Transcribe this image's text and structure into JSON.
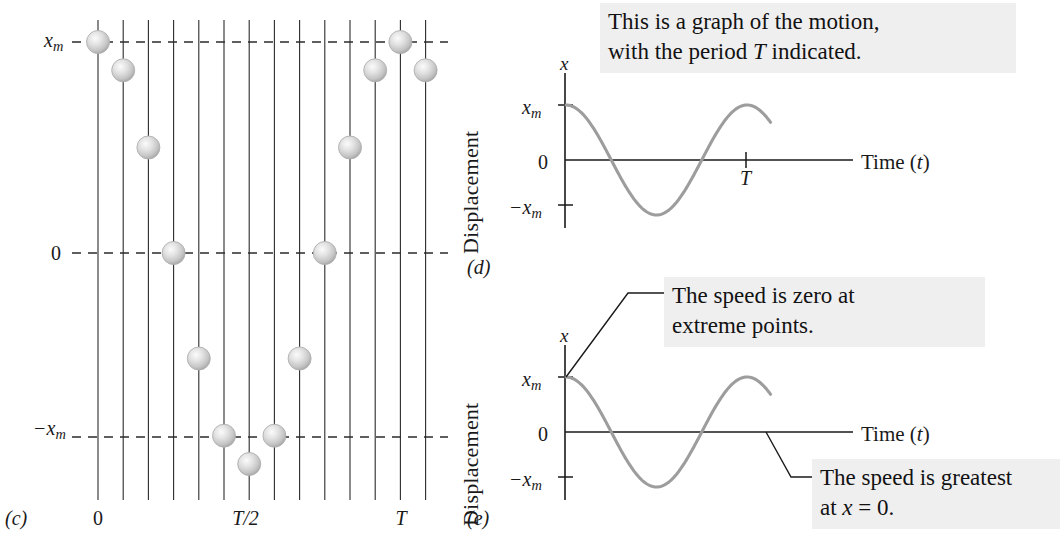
{
  "figure": {
    "panels": [
      {
        "id": "c",
        "label": "(c)"
      },
      {
        "id": "d",
        "label": "(d)"
      },
      {
        "id": "e",
        "label": "(e)"
      }
    ]
  },
  "panel_c": {
    "label": "(c)",
    "y_axis_labels": {
      "top": "x",
      "top_sub": "m",
      "middle": "0",
      "bottom_prefix": "−x",
      "bottom_sub": "m"
    },
    "x_tick_labels": [
      {
        "text": "0",
        "line_index": 0
      },
      {
        "text": "T/2",
        "line_index": 6
      },
      {
        "text": "T",
        "line_index": 12
      }
    ],
    "num_vertical_lines": 14,
    "ball_positions": [
      {
        "line_index": 0,
        "value": 1.0
      },
      {
        "line_index": 1,
        "value": 0.866
      },
      {
        "line_index": 2,
        "value": 0.5
      },
      {
        "line_index": 3,
        "value": 0.0
      },
      {
        "line_index": 4,
        "value": -0.5
      },
      {
        "line_index": 5,
        "value": -0.866
      },
      {
        "line_index": 6,
        "value": -1.0
      },
      {
        "line_index": 7,
        "value": -0.866
      },
      {
        "line_index": 8,
        "value": -0.5
      },
      {
        "line_index": 9,
        "value": 0.0
      },
      {
        "line_index": 10,
        "value": 0.5
      },
      {
        "line_index": 11,
        "value": 0.866
      },
      {
        "line_index": 12,
        "value": 1.0
      },
      {
        "line_index": 13,
        "value": 0.866
      }
    ]
  },
  "panel_d": {
    "label": "(d)",
    "caption": "This is a graph of the motion, with the period T indicated.",
    "caption_line1": "This is a graph of the motion,",
    "caption_line2_a": "with the period ",
    "caption_line2_t": "T",
    "caption_line2_b": " indicated.",
    "y_axis_title": "Displacement",
    "y_axis_symbol": "x",
    "y_ticks": [
      {
        "text_prefix": "x",
        "text_sub": "m",
        "value": 1.0
      },
      {
        "text_prefix": "0",
        "text_sub": "",
        "value": 0.0
      },
      {
        "text_prefix": "−x",
        "text_sub": "m",
        "value": -1.0
      }
    ],
    "x_axis_label_a": "Time (",
    "x_axis_label_t": "t",
    "x_axis_label_b": ")",
    "x_tick_label": "T"
  },
  "panel_e": {
    "label": "(e)",
    "callout_top_line1": "The speed is zero at",
    "callout_top_line2": "extreme points.",
    "callout_bottom_line1": "The speed is greatest",
    "callout_bottom_line2_a": "at ",
    "callout_bottom_line2_x": "x",
    "callout_bottom_line2_b": " = 0.",
    "y_axis_title": "Displacement",
    "y_axis_symbol": "x",
    "y_ticks": [
      {
        "text_prefix": "x",
        "text_sub": "m",
        "value": 1.0
      },
      {
        "text_prefix": "0",
        "text_sub": "",
        "value": 0.0
      },
      {
        "text_prefix": "−x",
        "text_sub": "m",
        "value": -1.0
      }
    ],
    "x_axis_label_a": "Time (",
    "x_axis_label_t": "t",
    "x_axis_label_b": ")"
  },
  "chart_data": [
    {
      "type": "scatter",
      "title": "(c) Strobe positions of oscillating block",
      "xlabel": "time",
      "ylabel": "displacement",
      "x": [
        0,
        1,
        2,
        3,
        4,
        5,
        6,
        7,
        8,
        9,
        10,
        11,
        12,
        13
      ],
      "xtick_labels": [
        "0",
        "",
        "",
        "",
        "",
        "",
        "T/2",
        "",
        "",
        "",
        "",
        "",
        "T",
        ""
      ],
      "values": [
        1.0,
        0.866,
        0.5,
        0.0,
        -0.5,
        -0.866,
        -1.0,
        -0.866,
        -0.5,
        0.0,
        0.5,
        0.866,
        1.0,
        0.866
      ],
      "ylim": [
        -1.0,
        1.0
      ],
      "ytick_labels": [
        "x_m",
        "0",
        "-x_m"
      ],
      "grid": "vertical lines at each sample; horizontal dashed lines at x_m, 0, -x_m"
    },
    {
      "type": "line",
      "title": "(d) x versus t",
      "xlabel": "Time (t)",
      "ylabel": "Displacement",
      "function": "x = x_m cos(2*pi*t/T)",
      "ylim": [
        -1.0,
        1.0
      ],
      "ytick_labels": [
        "x_m",
        "0",
        "-x_m"
      ],
      "xtick_labels": [
        "T"
      ],
      "xlim": [
        0,
        1.15
      ],
      "grid": false,
      "legend": "none",
      "annotations": [
        "This is a graph of the motion, with the period T indicated."
      ]
    },
    {
      "type": "line",
      "title": "(e) x versus t with speed annotations",
      "xlabel": "Time (t)",
      "ylabel": "Displacement",
      "function": "x = x_m cos(2*pi*t/T)",
      "ylim": [
        -1.0,
        1.0
      ],
      "ytick_labels": [
        "x_m",
        "0",
        "-x_m"
      ],
      "xlim": [
        0,
        1.15
      ],
      "grid": false,
      "legend": "none",
      "annotations": [
        "The speed is zero at extreme points.",
        "The speed is greatest at x = 0."
      ]
    }
  ],
  "colors": {
    "ink": "#1a1a1a",
    "curve": "#9a9a9a",
    "ball_light": "#f2f2f2",
    "ball_mid": "#cfcfcf",
    "ball_edge": "#a8a8a8",
    "callout_bg": "#f0eff0"
  }
}
